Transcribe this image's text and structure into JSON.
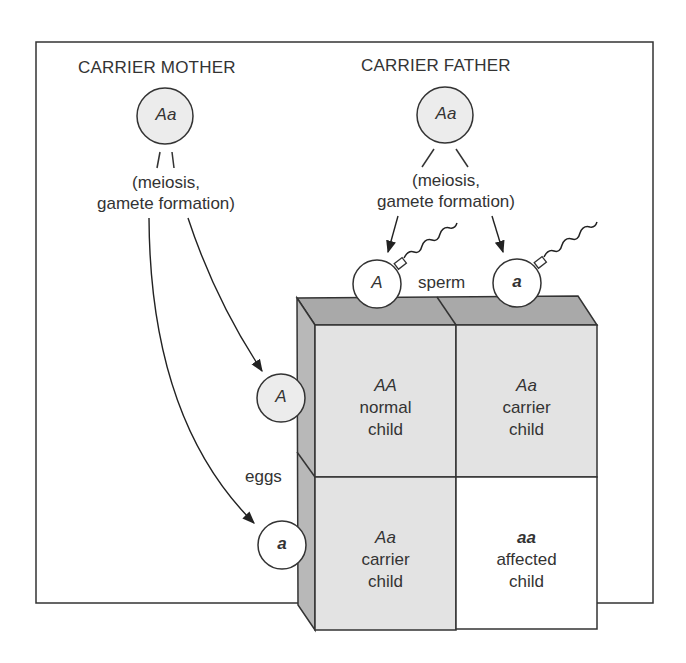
{
  "parents": {
    "mother": {
      "label": "CARRIER MOTHER",
      "genotype": "Aa",
      "process": [
        "(meiosis,",
        "gamete formation)"
      ]
    },
    "father": {
      "label": "CARRIER FATHER",
      "genotype": "Aa",
      "process": [
        "(meiosis,",
        "gamete formation)"
      ]
    }
  },
  "gametes": {
    "sperm_label": "sperm",
    "eggs_label": "eggs",
    "sperm": [
      "A",
      "a"
    ],
    "eggs": [
      "A",
      "a"
    ]
  },
  "grid": [
    [
      {
        "genotype": "AA",
        "line1": "normal",
        "line2": "child",
        "shaded": true
      },
      {
        "genotype": "Aa",
        "line1": "carrier",
        "line2": "child",
        "shaded": true
      }
    ],
    [
      {
        "genotype": "Aa",
        "line1": "carrier",
        "line2": "child",
        "shaded": true
      },
      {
        "genotype": "aa",
        "line1": "affected",
        "line2": "child",
        "shaded": false
      }
    ]
  ],
  "colors": {
    "line": "#333333",
    "cell_shade": "#e3e3e3",
    "top_face": "#a9a9a9",
    "side_face": "#b8b8b8",
    "circle_fill": "#ececec",
    "white": "#ffffff"
  }
}
